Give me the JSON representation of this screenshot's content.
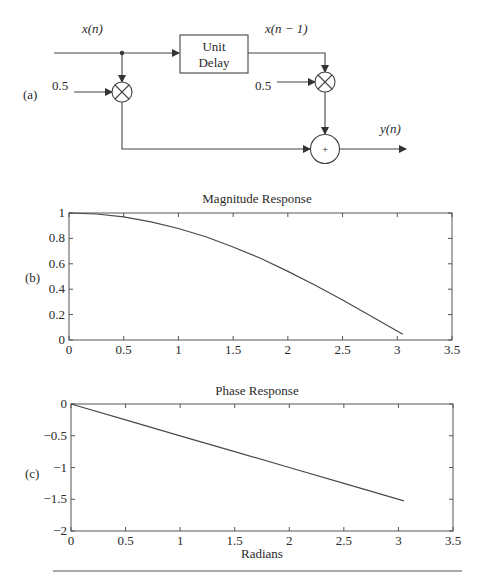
{
  "diagram": {
    "panel_label": "(a)",
    "input_label": "x(n)",
    "delay_label_line1": "Unit",
    "delay_label_line2": "Delay",
    "delayed_label": "x(n − 1)",
    "coef1": "0.5",
    "coef2": "0.5",
    "adder_symbol": "+",
    "output_label": "y(n)"
  },
  "chart_data": [
    {
      "type": "line",
      "panel_label": "(b)",
      "title": "Magnitude Response",
      "xlabel": "",
      "ylabel": "",
      "xlim": [
        0,
        3.5
      ],
      "ylim": [
        0,
        1
      ],
      "xticks": [
        "0",
        "0.5",
        "1",
        "1.5",
        "2",
        "2.5",
        "3",
        "3.5"
      ],
      "yticks": [
        "0",
        "0.2",
        "0.4",
        "0.6",
        "0.8",
        "1"
      ],
      "grid": false,
      "x": [
        0,
        0.25,
        0.5,
        0.75,
        1.0,
        1.25,
        1.5,
        1.75,
        2.0,
        2.25,
        2.5,
        2.75,
        3.05
      ],
      "values": [
        1.0,
        0.992,
        0.969,
        0.93,
        0.878,
        0.813,
        0.732,
        0.643,
        0.54,
        0.431,
        0.315,
        0.193,
        0.045
      ]
    },
    {
      "type": "line",
      "panel_label": "(c)",
      "title": "Phase Response",
      "xlabel": "Radians",
      "ylabel": "",
      "xlim": [
        0,
        3.5
      ],
      "ylim": [
        -2,
        0
      ],
      "xticks": [
        "0",
        "0.5",
        "1",
        "1.5",
        "2",
        "2.5",
        "3",
        "3.5"
      ],
      "yticks": [
        "0",
        "−0.5",
        "−1",
        "−1.5",
        "−2"
      ],
      "grid": false,
      "x": [
        0,
        0.5,
        1.0,
        1.5,
        2.0,
        2.5,
        3.05
      ],
      "values": [
        0,
        -0.25,
        -0.5,
        -0.75,
        -1.0,
        -1.25,
        -1.525
      ]
    }
  ]
}
